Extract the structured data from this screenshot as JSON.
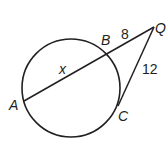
{
  "diagram": {
    "type": "circle-secant-tangent",
    "points": {
      "A": {
        "label": "A"
      },
      "B": {
        "label": "B"
      },
      "C": {
        "label": "C"
      },
      "Q": {
        "label": "Q"
      }
    },
    "segments": {
      "AB": {
        "label": "x"
      },
      "BQ": {
        "label": "8"
      },
      "CQ": {
        "label": "12"
      }
    },
    "colors": {
      "stroke": "#231f20",
      "background": "#ffffff"
    }
  }
}
